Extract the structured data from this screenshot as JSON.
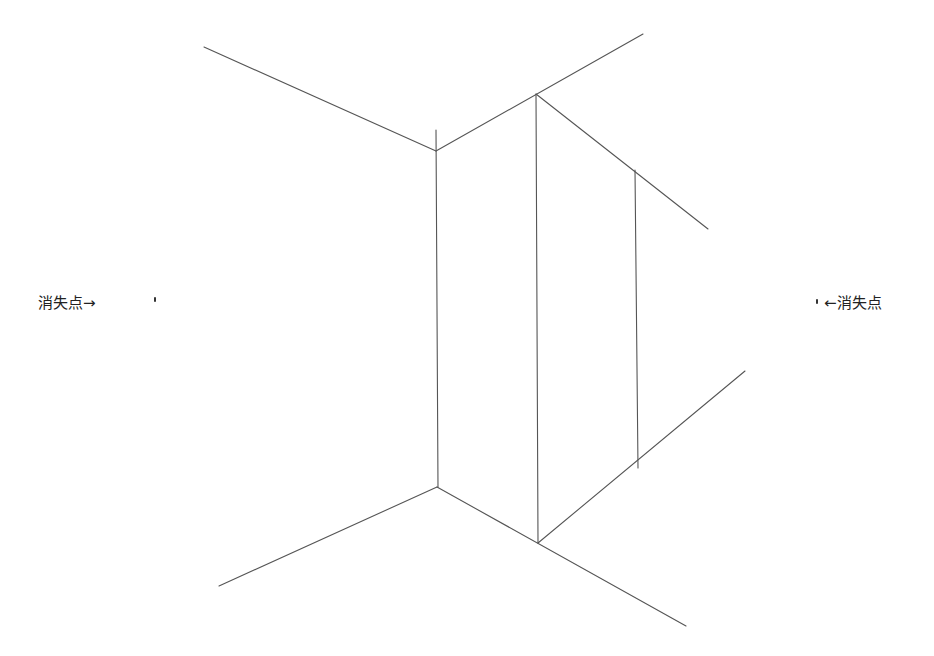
{
  "labels": {
    "left": "消失点→",
    "right": "←消失点"
  },
  "colors": {
    "line": "#555555",
    "text": "#222222",
    "background": "#ffffff"
  },
  "vanishing_points": {
    "left": {
      "x": 155,
      "y": 299
    },
    "right": {
      "x": 818,
      "y": 301
    }
  },
  "lines": [
    {
      "name": "ceiling-left-edge",
      "x1": 204,
      "y1": 47,
      "x2": 436,
      "y2": 151
    },
    {
      "name": "ceiling-right-edge",
      "x1": 436,
      "y1": 151,
      "x2": 643,
      "y2": 34
    },
    {
      "name": "corner-vertical",
      "x1": 436,
      "y1": 130,
      "x2": 438,
      "y2": 487
    },
    {
      "name": "panel-front-vertical",
      "x1": 536,
      "y1": 94,
      "x2": 538,
      "y2": 543
    },
    {
      "name": "panel-top-edge",
      "x1": 536,
      "y1": 94,
      "x2": 708,
      "y2": 229
    },
    {
      "name": "panel-back-vertical",
      "x1": 635,
      "y1": 170,
      "x2": 638,
      "y2": 468
    },
    {
      "name": "panel-bottom-edge",
      "x1": 538,
      "y1": 543,
      "x2": 745,
      "y2": 371
    },
    {
      "name": "floor-left-edge",
      "x1": 219,
      "y1": 586,
      "x2": 437,
      "y2": 487
    },
    {
      "name": "floor-right-edge",
      "x1": 437,
      "y1": 487,
      "x2": 686,
      "y2": 626
    }
  ]
}
